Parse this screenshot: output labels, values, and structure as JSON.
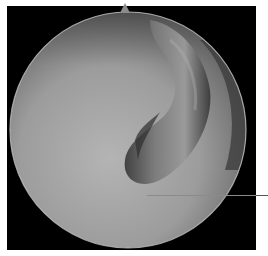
{
  "image": {
    "kind": "arthroscopic view",
    "background_color": "#000000",
    "page_color": "#ffffff",
    "field_of_view": {
      "shape": "circle",
      "center": [
        128,
        130
      ],
      "radius": 118
    },
    "structures": [
      {
        "name": "tubular-tissue",
        "description": "curved fibrous band sweeping from top-center down to the center-right",
        "color": "#5e5e5e"
      },
      {
        "name": "smooth-surface",
        "description": "pale smooth surface filling the lower-left field",
        "color": "#a8a8a8"
      }
    ],
    "annotation": {
      "type": "pointer-line",
      "from": [
        147,
        195
      ],
      "to": [
        268,
        195
      ],
      "label": ""
    }
  }
}
